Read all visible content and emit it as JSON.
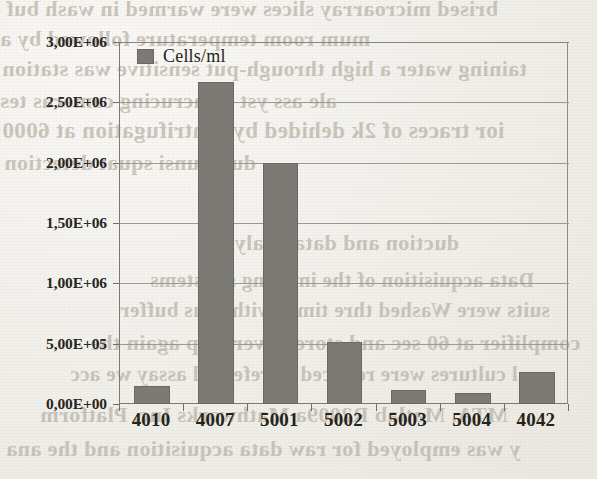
{
  "chart_data": {
    "type": "bar",
    "title": "",
    "xlabel": "",
    "ylabel": "",
    "categories": [
      "4010",
      "4007",
      "5001",
      "5002",
      "5003",
      "5004",
      "4042"
    ],
    "series": [
      {
        "name": "Cells/ml",
        "values": [
          150000,
          2670000,
          2000000,
          510000,
          120000,
          90000,
          265000
        ]
      }
    ],
    "ylim": [
      0,
      3000000
    ],
    "ytick_values": [
      0,
      500000,
      1000000,
      1500000,
      2000000,
      2500000,
      3000000
    ],
    "ytick_labels": [
      "0,00E+00",
      "5,00E+05",
      "1,00E+06",
      "1,50E+06",
      "2,00E+06",
      "2,50E+06",
      "3,00E+06"
    ],
    "grid": true,
    "legend": {
      "position": "inside-top-left",
      "entries": [
        {
          "label": "Cells/ml",
          "color": "#7c7a75"
        }
      ]
    },
    "bar_color": "#7c7a75"
  },
  "background_text": {
    "lines": [
      "brised microarray slices were warmed in wash buf",
      "mum room temperature followed by a",
      "taining water a high through-put sensitive was station",
      "ale ass yst sumcrucing cameras tes",
      "ior traces of 2k dehided by centrifugation at 6000",
      "dupli unsi squat detection",
      "duction and data analysis",
      "Data acquisition of the imaging s systems",
      "suits were Washed thre times with C us buffer",
      "complifier at 60 sec and stored over chip again the",
      "l cultures were reduced as referred assay we acc",
      "MTA. Matlab R2009a Mathworks Inc. Platform",
      "y was employed for raw data acquisition and the ana"
    ]
  }
}
